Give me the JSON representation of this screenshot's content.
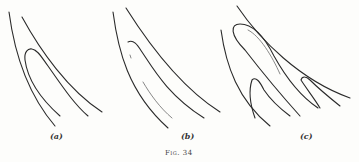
{
  "figure": {
    "caption": "Fig. 34",
    "panels": [
      {
        "id": "a",
        "label": "(a)"
      },
      {
        "id": "b",
        "label": "(b)"
      },
      {
        "id": "c",
        "label": "(c)"
      }
    ]
  },
  "colors": {
    "background": "#fdfdfb",
    "ink": "#2a2a2a"
  }
}
